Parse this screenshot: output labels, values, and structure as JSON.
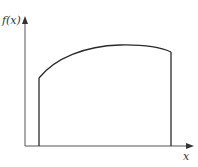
{
  "diagram": {
    "y_axis_label": "f(x)",
    "x_axis_label": "x",
    "line_color": "#2a2a2a",
    "axis_color": "#444444"
  }
}
